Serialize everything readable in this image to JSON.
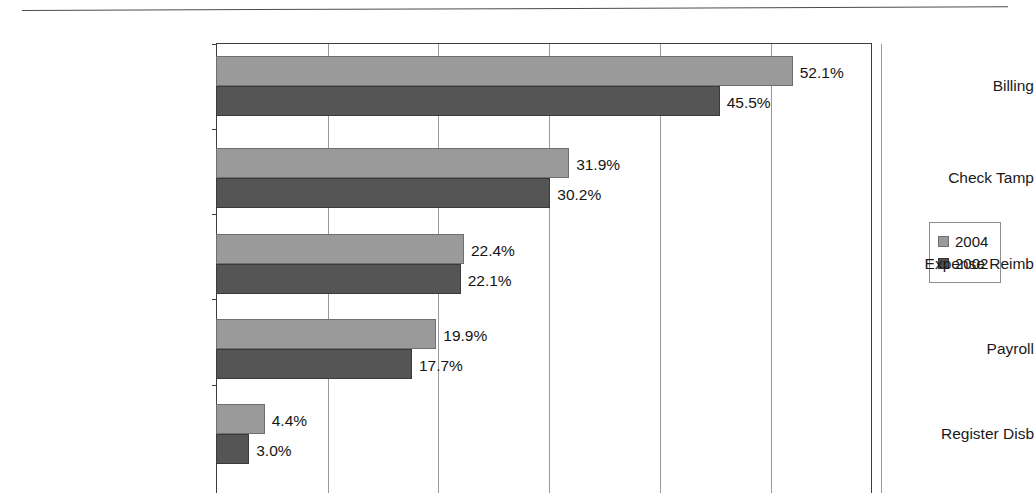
{
  "page": {
    "top_rule_present": true,
    "cut_off_text_above_rule": ""
  },
  "chart_data": {
    "type": "bar",
    "orientation": "horizontal",
    "title": "",
    "subtitle": "",
    "xlabel": "",
    "ylabel": "",
    "categories": [
      "Billing",
      "Check Tamp",
      "Expense Reimb",
      "Payroll",
      "Register Disb"
    ],
    "series": [
      {
        "name": "2004",
        "color": "#9a9a9a",
        "values": [
          52.1,
          31.9,
          22.4,
          19.9,
          4.4
        ],
        "labels": [
          "52.1%",
          "31.9%",
          "22.4%",
          "19.9%",
          "4.4%"
        ]
      },
      {
        "name": "2002",
        "color": "#555555",
        "values": [
          45.5,
          30.2,
          22.1,
          17.7,
          3.0
        ],
        "labels": [
          "45.5%",
          "30.2%",
          "22.1%",
          "17.7%",
          "3.0%"
        ]
      }
    ],
    "value_unit": "%",
    "xlim": [
      0,
      60
    ],
    "x_gridline_values": [
      0,
      10,
      20,
      30,
      40,
      50,
      60
    ],
    "x_tick_labels": [],
    "grid": true,
    "grid_axis": "x",
    "legend": {
      "position": "right",
      "entries": [
        {
          "label": "2004",
          "color": "#9a9a9a"
        },
        {
          "label": "2002",
          "color": "#4f4f4f"
        }
      ]
    }
  },
  "legend": {
    "entries": [
      {
        "label": "2004"
      },
      {
        "label": "2002"
      }
    ]
  }
}
